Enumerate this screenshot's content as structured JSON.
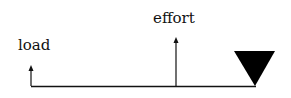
{
  "diagram": {
    "type": "lever",
    "labels": {
      "load": "load",
      "effort": "effort"
    },
    "colors": {
      "line": "#111111",
      "fulcrum": "#000000"
    }
  }
}
